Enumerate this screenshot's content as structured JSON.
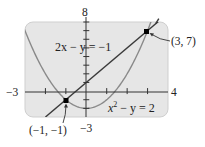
{
  "chart_data": {
    "type": "line",
    "title": "",
    "xlabel": "",
    "ylabel": "",
    "xlim": [
      -3,
      4
    ],
    "ylim": [
      -3,
      8
    ],
    "grid": false,
    "tick_labels": {
      "x_min": "−3",
      "x_max": "4",
      "y_max": "8",
      "y_min": "−3"
    },
    "series": [
      {
        "name": "2x − y = −1",
        "kind": "line",
        "equation": "y = 2x + 1",
        "color": "#3a3a3a"
      },
      {
        "name": "x² − y = 2",
        "kind": "parabola",
        "equation": "y = x^2 - 2",
        "color": "#8a8a8a"
      }
    ],
    "intersections": [
      {
        "label": "(3, 7)",
        "x": 3,
        "y": 7
      },
      {
        "label": "(−1, −1)",
        "x": -1,
        "y": -1
      }
    ],
    "annotations": {
      "line_eq": "2x − y = −1",
      "parabola_eq_left": "x",
      "parabola_eq_sup": "2",
      "parabola_eq_right": " − y = 2"
    },
    "colors": {
      "panel_bg": "#e6e6e6",
      "panel_border": "#cfcfcf",
      "axis": "#333333",
      "line": "#3a3a3a",
      "parabola": "#8a8a8a",
      "point": "#000000"
    }
  }
}
